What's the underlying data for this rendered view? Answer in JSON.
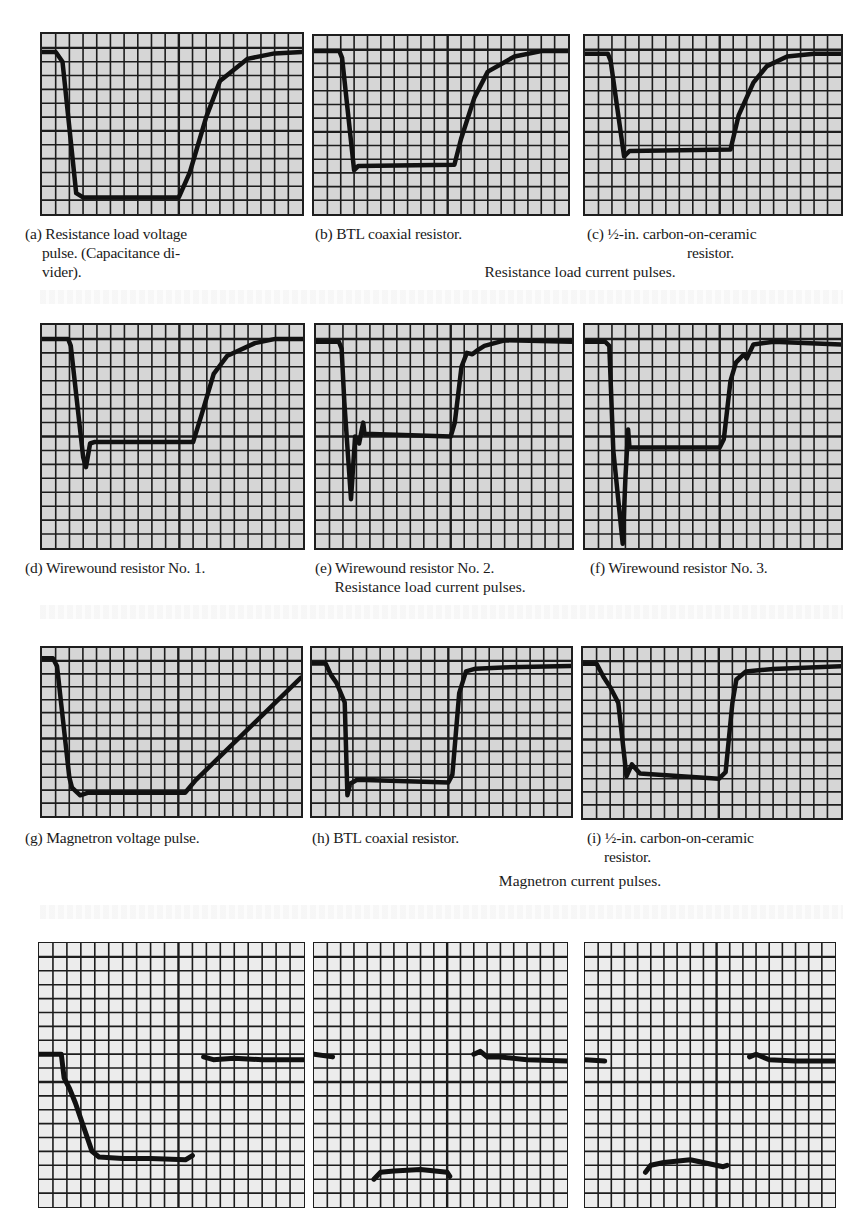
{
  "page": {
    "header_fragment": ""
  },
  "rows": [
    {
      "group_caption": "Resistance load current pulses.",
      "panels": [
        {
          "letter": "(a)",
          "caption_lines": [
            "Resistance load voltage",
            "pulse. (Capacitance di-",
            "vider)."
          ]
        },
        {
          "letter": "(b)",
          "caption_lines": [
            "BTL coaxial resistor."
          ]
        },
        {
          "letter": "(c)",
          "caption_lines": [
            "½-in. carbon-on-ceramic",
            "resistor."
          ]
        }
      ]
    },
    {
      "group_caption": "Resistance load current pulses.",
      "panels": [
        {
          "letter": "(d)",
          "caption_lines": [
            "Wirewound resistor No. 1."
          ]
        },
        {
          "letter": "(e)",
          "caption_lines": [
            "Wirewound resistor No. 2."
          ]
        },
        {
          "letter": "(f)",
          "caption_lines": [
            "Wirewound resistor No. 3."
          ]
        }
      ]
    },
    {
      "group_caption": "Magnetron current pulses.",
      "panels": [
        {
          "letter": "(g)",
          "caption_lines": [
            "Magnetron voltage pulse."
          ]
        },
        {
          "letter": "(h)",
          "caption_lines": [
            "BTL coaxial resistor."
          ]
        },
        {
          "letter": "(i)",
          "caption_lines": [
            "½-in. carbon-on-ceramic",
            "resistor."
          ]
        }
      ]
    },
    {
      "group_caption": "",
      "panels": [
        {
          "letter": "",
          "caption_lines": []
        },
        {
          "letter": "",
          "caption_lines": []
        },
        {
          "letter": "",
          "caption_lines": []
        }
      ]
    }
  ],
  "chart_data": [
    {
      "id": "a",
      "type": "line",
      "title": "(a) Resistance load voltage pulse. (Capacitance divider).",
      "xlabel": "",
      "ylabel": "",
      "grid": {
        "cols": 19,
        "rows": 13
      },
      "x": [
        0,
        1,
        1.5,
        2.5,
        3.0,
        10.0,
        10.8,
        12,
        13,
        15,
        17,
        19
      ],
      "y": [
        11.7,
        11.7,
        11,
        1.5,
        1.2,
        1.2,
        3,
        7,
        9.6,
        11.2,
        11.6,
        11.7
      ],
      "xlim": [
        0,
        19
      ],
      "ylim": [
        0,
        13
      ]
    },
    {
      "id": "b",
      "type": "line",
      "title": "(b) BTL coaxial resistor.",
      "grid": {
        "cols": 19,
        "rows": 13
      },
      "x": [
        0,
        1.9,
        2.1,
        3.0,
        3.3,
        10.5,
        11,
        12,
        13,
        15,
        17,
        19
      ],
      "y": [
        11.9,
        11.9,
        11.4,
        3.2,
        3.5,
        3.6,
        5.5,
        8.5,
        10.4,
        11.5,
        11.9,
        11.9
      ],
      "xlim": [
        0,
        19
      ],
      "ylim": [
        0,
        13
      ]
    },
    {
      "id": "c",
      "type": "line",
      "title": "(c) ½-in. carbon-on-ceramic resistor.",
      "grid": {
        "cols": 19,
        "rows": 13
      },
      "x": [
        0,
        1.7,
        1.9,
        2.9,
        3.3,
        10.8,
        11.4,
        12.5,
        13.5,
        15,
        17,
        19
      ],
      "y": [
        11.7,
        11.7,
        11.2,
        4.2,
        4.6,
        4.7,
        7.2,
        9.6,
        10.8,
        11.5,
        11.7,
        11.7
      ],
      "xlim": [
        0,
        19
      ],
      "ylim": [
        0,
        13
      ]
    },
    {
      "id": "d",
      "type": "line",
      "title": "(d) Wirewound resistor No. 1.",
      "grid": {
        "cols": 19,
        "rows": 16
      },
      "x": [
        0,
        1.9,
        2.1,
        3.0,
        3.2,
        3.5,
        3.8,
        11,
        11.6,
        12.5,
        13.5,
        15.5,
        17,
        19
      ],
      "y": [
        15,
        15,
        14.5,
        6.5,
        5.8,
        7.5,
        7.6,
        7.6,
        9.5,
        12.5,
        13.8,
        14.7,
        15,
        15
      ],
      "xlim": [
        0,
        19
      ],
      "ylim": [
        0,
        16
      ]
    },
    {
      "id": "e",
      "type": "line",
      "title": "(e) Wirewound resistor No. 2.",
      "grid": {
        "cols": 19,
        "rows": 16
      },
      "x": [
        0,
        1.7,
        1.9,
        2.1,
        2.6,
        2.9,
        3.2,
        3.5,
        3.6,
        10,
        10.3,
        10.8,
        11.2,
        11.6,
        12,
        12.5,
        14,
        19
      ],
      "y": [
        14.8,
        14.8,
        14.3,
        10.5,
        3.5,
        8,
        7.5,
        9,
        8.2,
        8,
        9,
        13,
        14,
        13.9,
        14.2,
        14.5,
        14.9,
        14.8
      ],
      "xlim": [
        0,
        19
      ],
      "ylim": [
        0,
        16
      ]
    },
    {
      "id": "f",
      "type": "line",
      "title": "(f) Wirewound resistor No. 3.",
      "grid": {
        "cols": 19,
        "rows": 16
      },
      "x": [
        0,
        1.5,
        1.8,
        2.1,
        2.8,
        3.0,
        3.2,
        3.3,
        10,
        10.3,
        10.8,
        11.2,
        11.8,
        12,
        12.5,
        14,
        19
      ],
      "y": [
        14.8,
        14.8,
        14.5,
        7,
        0.3,
        5,
        8.5,
        7.2,
        7.2,
        7.8,
        12,
        13.3,
        13.9,
        13.6,
        14.6,
        14.8,
        14.6
      ],
      "xlim": [
        0,
        19
      ],
      "ylim": [
        0,
        16
      ]
    },
    {
      "id": "g",
      "type": "line",
      "title": "(g) Magnetron voltage pulse.",
      "grid": {
        "cols": 19,
        "rows": 13
      },
      "x": [
        0,
        0.8,
        1.1,
        2.0,
        2.2,
        2.8,
        3.4,
        10.5,
        11.3,
        19
      ],
      "y": [
        12.2,
        12.2,
        11.6,
        3,
        2.2,
        1.6,
        1.8,
        1.8,
        2.8,
        10.7
      ],
      "xlim": [
        0,
        19
      ],
      "ylim": [
        0,
        13
      ]
    },
    {
      "id": "h",
      "type": "line",
      "title": "(h) BTL coaxial resistor.",
      "grid": {
        "cols": 19,
        "rows": 13
      },
      "x": [
        0,
        1.0,
        1.4,
        1.8,
        2.4,
        2.6,
        2.8,
        3.3,
        10.0,
        10.3,
        10.8,
        11.3,
        12,
        14,
        19
      ],
      "y": [
        11.8,
        11.8,
        10.9,
        10.3,
        8.8,
        1.6,
        2.5,
        2.8,
        2.6,
        3.2,
        9.5,
        11.2,
        11.4,
        11.5,
        11.6
      ],
      "xlim": [
        0,
        19
      ],
      "ylim": [
        0,
        13
      ]
    },
    {
      "id": "i",
      "type": "line",
      "title": "(i) ½-in. carbon-on-ceramic resistor.",
      "grid": {
        "cols": 19,
        "rows": 13
      },
      "x": [
        0,
        1.0,
        1.5,
        2.0,
        2.6,
        3.2,
        3.6,
        4.2,
        10,
        10.5,
        11.0,
        11.3,
        12,
        14,
        19
      ],
      "y": [
        11.8,
        11.8,
        10.8,
        10,
        8.8,
        3.2,
        4.1,
        3.4,
        3.0,
        3.5,
        8.8,
        10.6,
        11.2,
        11.4,
        11.6
      ],
      "xlim": [
        0,
        19
      ],
      "ylim": [
        0,
        13
      ]
    },
    {
      "id": "j",
      "type": "scatter",
      "title": "Bottom row left (fragmentary trace)",
      "grid": {
        "cols": 19,
        "rows": 19
      },
      "x": [
        0,
        1.6,
        1.8,
        2.2,
        2.6,
        3.8,
        4.3,
        6,
        8,
        10.5,
        11,
        11.8,
        12.5,
        14,
        16,
        19
      ],
      "y": [
        11,
        11,
        9.3,
        8.5,
        7.5,
        4,
        3.6,
        3.5,
        3.5,
        3.4,
        3.7,
        10.8,
        10.6,
        10.7,
        10.6,
        10.6
      ],
      "xlim": [
        0,
        19
      ],
      "ylim": [
        0,
        19
      ]
    },
    {
      "id": "k",
      "type": "scatter",
      "title": "Bottom row middle (fragmentary trace)",
      "grid": {
        "cols": 19,
        "rows": 19
      },
      "x": [
        0,
        1.4,
        4.5,
        5.0,
        6.0,
        8,
        10,
        10.2,
        12,
        12.5,
        13,
        14,
        16,
        19
      ],
      "y": [
        11,
        10.8,
        2.0,
        2.5,
        2.6,
        2.7,
        2.5,
        2.2,
        11,
        11.2,
        10.8,
        10.8,
        10.6,
        10.5
      ],
      "xlim": [
        0,
        19
      ],
      "ylim": [
        0,
        19
      ]
    },
    {
      "id": "l",
      "type": "scatter",
      "title": "Bottom row right (fragmentary trace)",
      "grid": {
        "cols": 19,
        "rows": 19
      },
      "x": [
        0,
        1.5,
        4.6,
        5.0,
        6.0,
        8,
        10.5,
        10.8,
        12.5,
        13,
        14,
        16,
        19
      ],
      "y": [
        10.6,
        10.5,
        2.5,
        3.0,
        3.2,
        3.4,
        2.9,
        3.0,
        10.8,
        11,
        10.6,
        10.5,
        10.5
      ],
      "xlim": [
        0,
        19
      ],
      "ylim": [
        0,
        19
      ]
    }
  ]
}
